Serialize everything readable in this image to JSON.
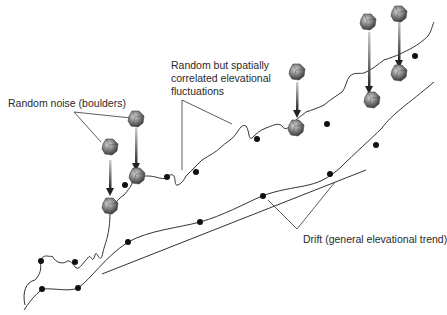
{
  "diagram": {
    "labels": {
      "noise": "Random noise (boulders)",
      "fluct_line1": "Random but spatially",
      "fluct_line2": "correlated elevational",
      "fluct_line3": "fluctuations",
      "drift": "Drift (general elevational trend)"
    },
    "colors": {
      "line": "#333333",
      "dot": "#111111",
      "boulder": "#6e6e6e",
      "arrow": "#333333"
    },
    "series": [
      {
        "name": "upper-surface",
        "description": "wavy surface with boulders"
      },
      {
        "name": "lower-surface",
        "description": "smooth correlated surface"
      },
      {
        "name": "drift-trend",
        "description": "straight trend line"
      }
    ]
  }
}
